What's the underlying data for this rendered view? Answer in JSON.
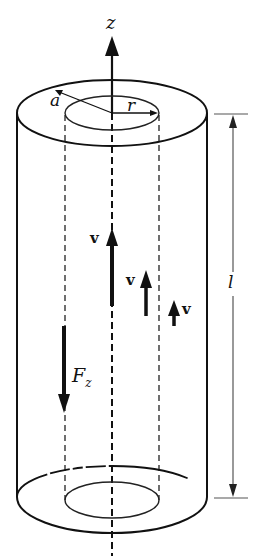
{
  "diagram": {
    "type": "cylindrical flow diagram",
    "labels": {
      "axis": "z",
      "outer_radius": "a",
      "inner_radius": "r",
      "length": "l",
      "velocity_center": "v",
      "velocity_mid": "v",
      "velocity_outer": "v",
      "force": "F",
      "force_sub": "z"
    },
    "colors": {
      "stroke": "#111111",
      "background": "#ffffff",
      "dimension_line": "#444444"
    }
  }
}
